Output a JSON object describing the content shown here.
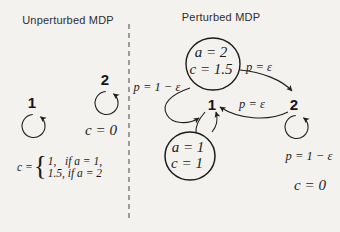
{
  "colors": {
    "background": "#f4f2ee",
    "ink": "#1f1f1f",
    "divider": "#555555"
  },
  "left_panel": {
    "title": "Unperturbed MDP",
    "state1_label": "1",
    "state2_label": "2",
    "state2_cost": "c = 0",
    "cost_formula": {
      "lhs": "c =",
      "brace": "{",
      "case1": "1,   if a = 1,",
      "case2": "1.5, if a = 2"
    }
  },
  "right_panel": {
    "title": "Perturbed MDP",
    "state1_label": "1",
    "state2_label": "2",
    "action2_circle": {
      "line1": "a = 2",
      "line2": "c = 1.5"
    },
    "action1_circle": {
      "line1": "a = 1",
      "line2": "c = 1"
    },
    "prob_stay_state1": "p = 1 − ε",
    "prob_1_to_2": "p = ε",
    "prob_2_to_1": "p = ε",
    "prob_stay_state2": "p = 1 − ε",
    "state2_cost": "c = 0"
  }
}
